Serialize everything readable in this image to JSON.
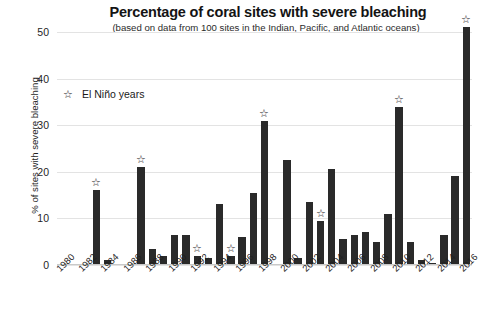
{
  "chart_data": {
    "type": "bar",
    "title": "Percentage of coral sites with severe bleaching",
    "subtitle": "(based on data from 100 sites in the Indian, Pacific, and Atlantic oceans)",
    "xlabel": "",
    "ylabel": "% of sites with severe bleaching",
    "ylim": [
      0,
      50
    ],
    "yticks": [
      0,
      10,
      20,
      30,
      40,
      50
    ],
    "ytick_labels": [
      "0",
      "10",
      "20",
      "30",
      "40",
      "50"
    ],
    "grid": true,
    "legend_position": "upper-left",
    "legend": [
      {
        "marker": "star",
        "label": "El Niño years"
      }
    ],
    "bar_color": "#2a2a2a",
    "x_tick_labels": [
      "1980",
      "1982",
      "1984",
      "1986",
      "1988",
      "1990",
      "1992",
      "1994",
      "1996",
      "1998",
      "2000",
      "2002",
      "2004",
      "2006",
      "2008",
      "2010",
      "2012",
      "2014",
      "2016"
    ],
    "x_tick_years": [
      1980,
      1982,
      1984,
      1986,
      1988,
      1990,
      1992,
      1994,
      1996,
      1998,
      2000,
      2002,
      2004,
      2006,
      2008,
      2010,
      2012,
      2014,
      2016
    ],
    "categories": [
      1980,
      1981,
      1982,
      1983,
      1984,
      1985,
      1986,
      1987,
      1988,
      1989,
      1990,
      1991,
      1992,
      1993,
      1994,
      1995,
      1996,
      1997,
      1998,
      1999,
      2000,
      2001,
      2002,
      2003,
      2004,
      2005,
      2006,
      2007,
      2008,
      2009,
      2010,
      2011,
      2012,
      2013,
      2014,
      2015,
      2016
    ],
    "values": [
      0,
      0,
      0,
      16,
      1,
      0,
      0,
      21,
      3.5,
      2,
      6.5,
      6.5,
      2,
      1.5,
      13,
      2,
      6,
      15.5,
      31,
      0,
      22.5,
      1.5,
      13.5,
      9.5,
      20.5,
      5.5,
      6.5,
      7,
      5,
      11,
      34,
      5,
      1,
      0.5,
      6.5,
      19,
      51
    ],
    "el_nino_years": [
      1983,
      1987,
      1992,
      1995,
      1998,
      2003,
      2010,
      2016
    ]
  }
}
